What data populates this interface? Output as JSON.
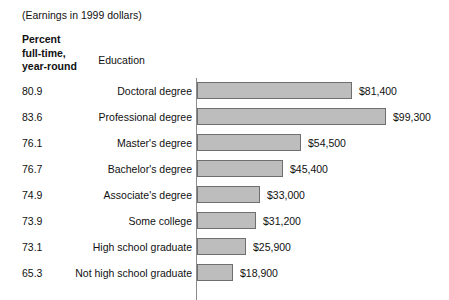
{
  "header": {
    "title": "(Earnings in 1999 dollars)",
    "percent_header_lines": [
      "Percent",
      "full-time,",
      "year-round"
    ],
    "education_header": "Education"
  },
  "style": {
    "bar_fill": "#bdbdbd",
    "bar_border": "#6f6f6f",
    "axis_color": "#8c8c8c",
    "background": "#ffffff",
    "text_color": "#111111"
  },
  "chart_data": {
    "type": "bar",
    "orientation": "horizontal",
    "title": "(Earnings in 1999 dollars)",
    "xlabel": "",
    "ylabel": "Education",
    "grid": false,
    "legend": "none",
    "axis_origin_x_px": 197,
    "px_per_dollar": 0.0019,
    "xlim": [
      0,
      99300
    ],
    "categories": [
      "Doctoral degree",
      "Professional degree",
      "Master's degree",
      "Bachelor's degree",
      "Associate's degree",
      "Some college",
      "High school graduate",
      "Not high school graduate"
    ],
    "values": [
      81400,
      99300,
      54500,
      45400,
      33000,
      31200,
      25900,
      18900
    ],
    "value_labels": [
      "$81,400",
      "$99,300",
      "$54,500",
      "$45,400",
      "$33,000",
      "$31,200",
      "$25,900",
      "$18,900"
    ],
    "series": [
      {
        "name": "Median earnings",
        "values": [
          81400,
          99300,
          54500,
          45400,
          33000,
          31200,
          25900,
          18900
        ]
      },
      {
        "name": "Percent full-time, year-round",
        "values": [
          80.9,
          83.6,
          76.1,
          76.7,
          74.9,
          73.9,
          73.1,
          65.3
        ]
      }
    ],
    "percent_labels": [
      "80.9",
      "83.6",
      "76.1",
      "76.7",
      "74.9",
      "73.9",
      "73.1",
      "65.3"
    ]
  },
  "rows": [
    {
      "percent": "80.9",
      "label": "Doctoral degree",
      "value": 81400,
      "value_label": "$81,400"
    },
    {
      "percent": "83.6",
      "label": "Professional degree",
      "value": 99300,
      "value_label": "$99,300"
    },
    {
      "percent": "76.1",
      "label": "Master's degree",
      "value": 54500,
      "value_label": "$54,500"
    },
    {
      "percent": "76.7",
      "label": "Bachelor's degree",
      "value": 45400,
      "value_label": "$45,400"
    },
    {
      "percent": "74.9",
      "label": "Associate's degree",
      "value": 33000,
      "value_label": "$33,000"
    },
    {
      "percent": "73.9",
      "label": "Some college",
      "value": 31200,
      "value_label": "$31,200"
    },
    {
      "percent": "73.1",
      "label": "High school graduate",
      "value": 25900,
      "value_label": "$25,900"
    },
    {
      "percent": "65.3",
      "label": "Not high school graduate",
      "value": 18900,
      "value_label": "$18,900"
    }
  ]
}
